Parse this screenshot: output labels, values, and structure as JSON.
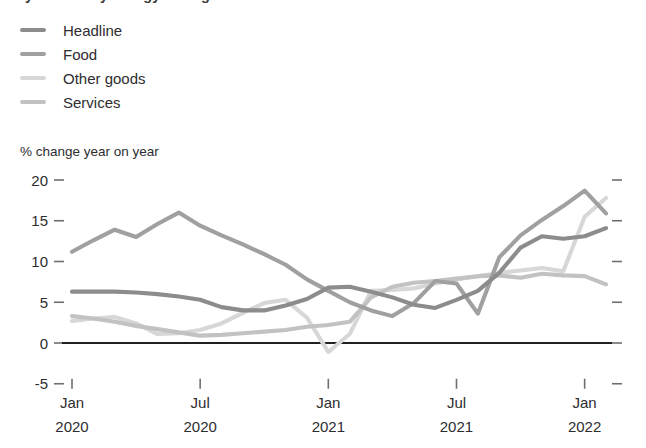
{
  "title_clipped": "fy-Jnm-nnuy-Lncigy-mn-ngoods-Lnn-0",
  "axis_caption": "% change year on year",
  "legend": {
    "items": [
      {
        "label": "Headline",
        "color": "#8c8c8e"
      },
      {
        "label": "Food",
        "color": "#a0a0a2"
      },
      {
        "label": "Other goods",
        "color": "#d7d7d8"
      },
      {
        "label": "Services",
        "color": "#c2c2c3"
      }
    ]
  },
  "chart_data": {
    "type": "line",
    "title": "",
    "xlabel": "",
    "ylabel": "% change year on year",
    "ylim": [
      -5,
      20
    ],
    "yticks": [
      20,
      15,
      10,
      5,
      0,
      -5
    ],
    "ytick_labels": [
      "20",
      "15",
      "10",
      "5",
      "0",
      "-5"
    ],
    "grid": false,
    "legend_position": "top-left",
    "x_tick_labels": [
      {
        "month": "Jan",
        "year": "2020"
      },
      {
        "month": "Jul",
        "year": "2020"
      },
      {
        "month": "Jan",
        "year": "2021"
      },
      {
        "month": "Jul",
        "year": "2021"
      },
      {
        "month": "Jan",
        "year": "2022"
      }
    ],
    "x_tick_index": [
      0,
      6,
      12,
      18,
      24
    ],
    "x": [
      0,
      1,
      2,
      3,
      4,
      5,
      6,
      7,
      8,
      9,
      10,
      11,
      12,
      13,
      14,
      15,
      16,
      17,
      18,
      19,
      20,
      21,
      22,
      23,
      24,
      25
    ],
    "series": [
      {
        "name": "Headline",
        "color": "#8c8c8e",
        "values": [
          6.3,
          6.3,
          6.3,
          6.2,
          6.0,
          5.7,
          5.3,
          4.4,
          4.0,
          4.0,
          4.6,
          5.4,
          6.8,
          6.9,
          6.3,
          5.6,
          4.7,
          4.3,
          5.3,
          6.4,
          8.6,
          11.7,
          13.1,
          12.8,
          13.1,
          14.1
        ]
      },
      {
        "name": "Food",
        "color": "#a0a0a2",
        "values": [
          11.2,
          12.6,
          13.9,
          13.0,
          14.6,
          16.0,
          14.4,
          13.2,
          12.1,
          10.9,
          9.6,
          7.8,
          6.4,
          5.0,
          4.0,
          3.3,
          4.9,
          7.6,
          7.3,
          3.6,
          10.5,
          13.2,
          15.1,
          16.8,
          18.7,
          15.9
        ]
      },
      {
        "name": "Other goods",
        "color": "#d7d7d8",
        "values": [
          2.7,
          3.0,
          3.2,
          2.4,
          1.1,
          1.2,
          1.6,
          2.4,
          3.7,
          4.9,
          5.3,
          3.1,
          -1.1,
          1.1,
          6.4,
          6.5,
          6.7,
          7.3,
          7.8,
          8.2,
          8.6,
          8.9,
          9.2,
          8.8,
          15.5,
          17.8
        ]
      },
      {
        "name": "Services",
        "color": "#c2c2c3",
        "values": [
          3.3,
          3.0,
          2.6,
          2.1,
          1.7,
          1.3,
          0.9,
          1.0,
          1.2,
          1.4,
          1.6,
          2.0,
          2.2,
          2.6,
          5.6,
          6.9,
          7.4,
          7.6,
          7.9,
          8.2,
          8.3,
          8.0,
          8.5,
          8.3,
          8.2,
          7.2
        ]
      }
    ]
  }
}
